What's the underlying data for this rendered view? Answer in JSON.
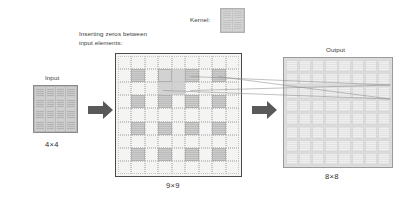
{
  "figure": {
    "background": "#ffffff"
  },
  "kernel": {
    "caption": "Kernel:",
    "rows": 2,
    "cols": 2,
    "fill": "#c2c2c2"
  },
  "input": {
    "caption": "Input",
    "dimension_label": "4×4",
    "rows": 4,
    "cols": 4,
    "fill": "#b4b4b4"
  },
  "zero_inserted": {
    "caption": "Inserting zeros between\ninput elements:",
    "dimension_label": "9×9",
    "rows": 9,
    "cols": 9,
    "value_positions": [
      [
        1,
        1
      ],
      [
        1,
        3
      ],
      [
        1,
        5
      ],
      [
        1,
        7
      ],
      [
        3,
        1
      ],
      [
        3,
        3
      ],
      [
        3,
        5
      ],
      [
        3,
        7
      ],
      [
        5,
        1
      ],
      [
        5,
        3
      ],
      [
        5,
        5
      ],
      [
        5,
        7
      ],
      [
        7,
        1
      ],
      [
        7,
        3
      ],
      [
        7,
        5
      ],
      [
        7,
        7
      ]
    ],
    "highlight_window": {
      "row": 1,
      "col": 3,
      "rows": 2,
      "cols": 2
    },
    "value_fill": "#bdbdbd",
    "zero_fill": "#f4f4f2",
    "border": "#4a4a4a"
  },
  "output": {
    "caption": "Output",
    "dimension_label": "8×8",
    "rows": 8,
    "cols": 8,
    "fill": "#efefef",
    "receptive_cell": {
      "row": 1,
      "col": 6
    }
  },
  "arrows": [
    {
      "name": "input-to-zero-inserted",
      "direction": "right",
      "color": "#595959"
    },
    {
      "name": "zero-inserted-to-output",
      "direction": "right",
      "color": "#595959"
    }
  ],
  "connectors": {
    "color": "#8c8c8c",
    "count": 4,
    "description": "thin lines mapping the 2×2 kernel window in the zero-inserted map to one output cell"
  }
}
